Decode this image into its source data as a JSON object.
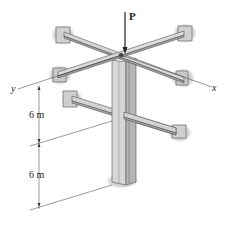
{
  "figure": {
    "load_label": "P",
    "axis_x_label": "x",
    "axis_y_label": "y",
    "dim_upper": "6 m",
    "dim_lower": "6 m"
  },
  "colors": {
    "member_light": "#d9d9d9",
    "member_mid": "#bdbdbd",
    "member_dark": "#8e8e8e",
    "outline": "#555555",
    "wall_shadow": "#c8c8c8",
    "line": "#333333"
  }
}
